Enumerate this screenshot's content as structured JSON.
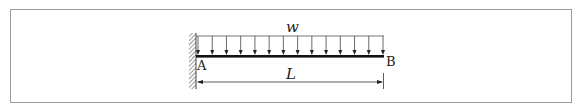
{
  "diagram": {
    "type": "cantilever-beam",
    "load_label": "w",
    "length_label": "L",
    "support_label": "A",
    "free_end_label": "B",
    "load_arrow_count": 14,
    "colors": {
      "frame": "#9a9a9a",
      "beam": "#111111",
      "load": "#333333",
      "dimension": "#333333",
      "hatch": "#555555"
    }
  }
}
